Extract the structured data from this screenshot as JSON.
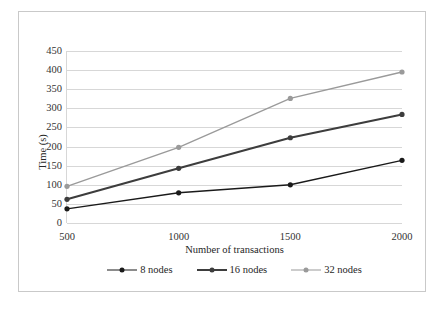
{
  "chart_data": {
    "type": "line",
    "title": "",
    "xlabel": "Number of transactions",
    "ylabel": "Time (s)",
    "categories": [
      "500",
      "1000",
      "1500",
      "2000"
    ],
    "x": [
      500,
      1000,
      1500,
      2000
    ],
    "xlim": [
      500,
      2000
    ],
    "ylim": [
      0,
      450
    ],
    "yticks": [
      "0",
      "50",
      "100",
      "150",
      "200",
      "250",
      "300",
      "350",
      "400",
      "450"
    ],
    "ytick_values": [
      0,
      50,
      100,
      150,
      200,
      250,
      300,
      350,
      400,
      450
    ],
    "grid": true,
    "legend_position": "bottom",
    "series": [
      {
        "name": "8 nodes",
        "values": [
          37,
          79,
          100,
          164
        ],
        "color": "#1a1a1a",
        "marker": "circle",
        "line_width": 1.4
      },
      {
        "name": "16 nodes",
        "values": [
          62,
          143,
          223,
          284
        ],
        "color": "#3d3d3d",
        "marker": "circle",
        "line_width": 2.1
      },
      {
        "name": "32 nodes",
        "values": [
          96,
          198,
          326,
          395
        ],
        "color": "#9a9a9a",
        "marker": "circle",
        "line_width": 1.4
      }
    ]
  },
  "figure": {
    "border_color": "#c9c9c9",
    "grid_color": "#d7d7d7",
    "background": "#ffffff"
  }
}
